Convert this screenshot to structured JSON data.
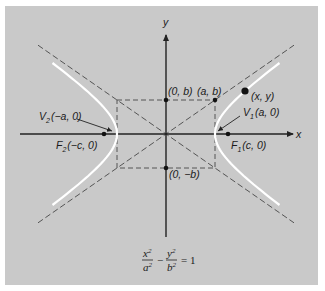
{
  "figure": {
    "background_color": "#c9c9c9",
    "axis_color": "#222222",
    "curve_color": "#ffffff",
    "dash_color": "#555555",
    "point_color": "#111111"
  },
  "geometry": {
    "center": [
      166,
      134
    ],
    "a_px": 49,
    "b_px": 34,
    "c_px": 62,
    "x_axis": {
      "x1": 20,
      "x2": 293,
      "y": 134
    },
    "y_axis": {
      "x": 166,
      "y1": 237,
      "y2": 35
    },
    "curve_y_extent": 71,
    "asymptote_x_extent": 128,
    "point_xy": [
      245,
      91
    ]
  },
  "axes": {
    "x_label": "x",
    "y_label": "y"
  },
  "labels": {
    "zero_b": "(0, b)",
    "a_b": "(a, b)",
    "zero_minus_b": "(0, −b)",
    "point": "(x, y)",
    "v1_prefix": "V",
    "v1_sub": "1",
    "v1_coord": "(a, 0)",
    "v2_prefix": "V",
    "v2_sub": "2",
    "v2_coord": "(−a, 0)",
    "f1_prefix": "F",
    "f1_sub": "1",
    "f1_coord": "(c, 0)",
    "f2_prefix": "F",
    "f2_sub": "2",
    "f2_coord": "(−c, 0)"
  },
  "equation": {
    "num1": "x",
    "den1": "a",
    "exp": "2",
    "minus": "−",
    "num2": "y",
    "den2": "b",
    "equals": "= 1"
  }
}
